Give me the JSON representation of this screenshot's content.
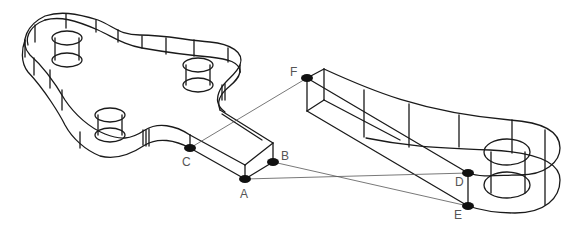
{
  "figure": {
    "colors": {
      "line": "#1a1a1a",
      "construction_line": "#555555",
      "point": "#111111",
      "label": "#555555",
      "background": "#ffffff"
    },
    "points": [
      {
        "id": "A",
        "label": "A",
        "x": 245,
        "y": 179
      },
      {
        "id": "B",
        "label": "B",
        "x": 273,
        "y": 162
      },
      {
        "id": "C",
        "label": "C",
        "x": 190,
        "y": 148
      },
      {
        "id": "D",
        "label": "D",
        "x": 468,
        "y": 173
      },
      {
        "id": "E",
        "label": "E",
        "x": 468,
        "y": 206
      },
      {
        "id": "F",
        "label": "F",
        "x": 307,
        "y": 78
      }
    ],
    "construction_lines": [
      {
        "from": "C",
        "to": "F"
      },
      {
        "from": "A",
        "to": "D"
      },
      {
        "from": "B",
        "to": "E"
      }
    ],
    "labels": {
      "A": "A",
      "B": "B",
      "C": "C",
      "D": "D",
      "E": "E",
      "F": "F"
    }
  }
}
